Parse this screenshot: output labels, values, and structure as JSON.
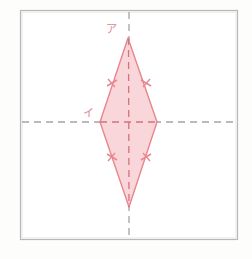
{
  "figure": {
    "type": "geometry-diagram",
    "caption_text": "",
    "background_color": "#fdfdfc",
    "frame": {
      "name": "outer-frame",
      "x": 20,
      "y": 10,
      "width": 218,
      "height": 230,
      "stroke_color": "#b8b8b8",
      "fill_color": "#ffffff"
    },
    "axes": [
      {
        "name": "vertical-axis",
        "orientation": "vertical",
        "x": 129,
        "y1": 12,
        "y2": 238,
        "style": "dashed",
        "color": "#a8a0a0"
      },
      {
        "name": "horizontal-axis",
        "orientation": "horizontal",
        "y": 122,
        "x1": 22,
        "x2": 236,
        "style": "dashed",
        "color": "#a8a0a0"
      }
    ],
    "shape": {
      "name": "rhombus",
      "kind": "kite",
      "fill_color": "#f8d6da",
      "stroke_color": "#e8868e",
      "vertices": [
        {
          "id": "top",
          "label": "ア",
          "x": 128,
          "y": 38
        },
        {
          "id": "right",
          "label": "",
          "x": 157,
          "y": 122
        },
        {
          "id": "bottom",
          "label": "",
          "x": 129,
          "y": 207
        },
        {
          "id": "left",
          "label": "イ",
          "x": 100,
          "y": 122
        }
      ],
      "diagonals": [
        {
          "name": "vertical-diagonal",
          "from": "top",
          "to": "bottom",
          "style": "dashed",
          "color": "#d4737c"
        },
        {
          "name": "horizontal-diagonal",
          "from": "left",
          "to": "right",
          "style": "dashed",
          "color": "#d4737c"
        }
      ],
      "tick_marks": [
        {
          "name": "tick-upper-left",
          "side": "top-left",
          "x": 111,
          "y": 83,
          "count": 1
        },
        {
          "name": "tick-upper-right",
          "side": "top-right",
          "x": 146,
          "y": 83,
          "count": 1
        },
        {
          "name": "tick-lower-left",
          "side": "bottom-left",
          "x": 111,
          "y": 157,
          "count": 1
        },
        {
          "name": "tick-lower-right",
          "side": "bottom-right",
          "x": 146,
          "y": 157,
          "count": 1
        }
      ]
    },
    "labels": [
      {
        "name": "label-a",
        "text": "ア",
        "x": 111,
        "y": 33,
        "color": "#e08890",
        "anchor_vertex": "top"
      },
      {
        "name": "label-i",
        "text": "イ",
        "x": 88,
        "y": 113,
        "color": "#e08890",
        "anchor_vertex": "left"
      }
    ],
    "colors": {
      "shape_fill": "#f8d6da",
      "shape_stroke": "#e8868e",
      "label_color": "#e08890",
      "axis_dash": "#a8a0a0",
      "diagonal_dash": "#d4737c",
      "frame_stroke": "#b8b8b8"
    }
  }
}
